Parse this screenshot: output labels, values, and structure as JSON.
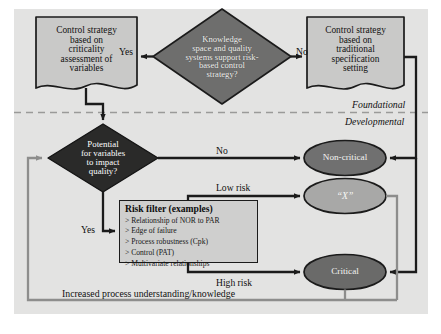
{
  "figure": {
    "panel_color": "#e3e3e2",
    "line_color": "#1b1b1b",
    "feedback_line_color": "#8d8d8c"
  },
  "nodes": {
    "control_strategy_criticality": {
      "label": "Control strategy based on criticality assessment of variables",
      "lines": [
        "Control strategy",
        "based on",
        "criticality",
        "assessment of",
        "variables"
      ],
      "shape": "document",
      "fill": "#c9c9c8"
    },
    "knowledge_decision": {
      "label": "Knowledge space and quality systems support risk-based control strategy?",
      "lines": [
        "Knowledge",
        "space and quality",
        "systems support risk-",
        "based control",
        "strategy?"
      ],
      "shape": "diamond",
      "fill": "#6e6e6d"
    },
    "control_strategy_traditional": {
      "label": "Control strategy based on traditional specification setting",
      "lines": [
        "Control strategy",
        "based on",
        "traditional",
        "specification",
        "setting"
      ],
      "shape": "document",
      "fill": "#c9c9c8"
    },
    "potential_decision": {
      "label": "Potential for variables to impact quality?",
      "lines": [
        "Potential",
        "for variables",
        "to impact",
        "quality?"
      ],
      "shape": "diamond",
      "fill": "#2a2a29"
    },
    "non_critical": {
      "label": "Non-critical",
      "shape": "ellipse",
      "fill": "#707070"
    },
    "x_node": {
      "label": "“X”",
      "shape": "ellipse",
      "fill": "#a8a8a7"
    },
    "critical": {
      "label": "Critical",
      "shape": "ellipse",
      "fill": "#6a6a69"
    },
    "risk_filter": {
      "title": "Risk filter (examples)",
      "items": [
        "Relationship of NOR to PAR",
        "Edge of failure",
        "Process robustness (Cpk)",
        "Control (PAT)",
        "Multivariate relationships"
      ],
      "shape": "rectangle",
      "fill": "#cfcfce"
    }
  },
  "edge_labels": {
    "yes_top": "Yes",
    "no_top": "No",
    "no_mid": "No",
    "yes_mid": "Yes",
    "low_risk": "Low risk",
    "high_risk": "High risk"
  },
  "zone_labels": {
    "foundational": "Foundational",
    "developmental": "Developmental"
  },
  "feedback": {
    "label": "Increased process understanding/knowledge"
  }
}
